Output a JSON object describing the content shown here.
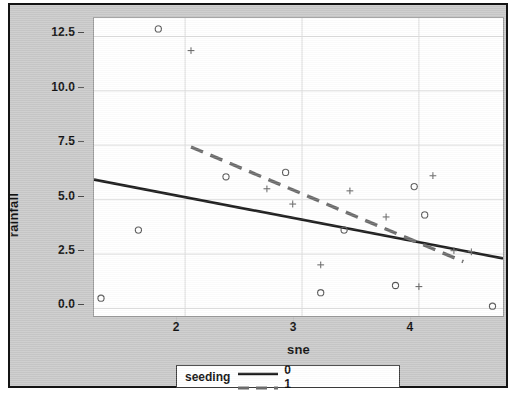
{
  "scan": {
    "top_strip_text": "· · ·"
  },
  "legend": {
    "title": "seeding",
    "entries": [
      {
        "label": "0",
        "style": "solid",
        "color": "#1a1a1a"
      },
      {
        "label": "1",
        "style": "dashed",
        "color": "#6b6b6b"
      }
    ]
  },
  "chart_data": {
    "type": "scatter",
    "title": "",
    "xlabel": "sne",
    "ylabel": "rainfall",
    "xlim": [
      1.22,
      4.72
    ],
    "ylim": [
      -0.35,
      13.35
    ],
    "xticks": [
      2,
      3,
      4
    ],
    "xtick_labels": [
      "2",
      "3",
      "4"
    ],
    "yticks": [
      0.0,
      2.5,
      5.0,
      7.5,
      10.0,
      12.5
    ],
    "ytick_labels": [
      "0.0",
      "2.5",
      "5.0",
      "7.5",
      "10.0",
      "12.5"
    ],
    "grid": true,
    "grid_color": "#dcdcdc",
    "legend_position": "below-axes",
    "series": [
      {
        "name": "0",
        "marker": "circle",
        "color": "#555555",
        "points": [
          {
            "x": 1.28,
            "y": 0.47
          },
          {
            "x": 1.6,
            "y": 3.6
          },
          {
            "x": 1.77,
            "y": 12.85
          },
          {
            "x": 2.35,
            "y": 6.05
          },
          {
            "x": 2.86,
            "y": 6.25
          },
          {
            "x": 3.16,
            "y": 0.72
          },
          {
            "x": 3.36,
            "y": 3.6
          },
          {
            "x": 3.8,
            "y": 1.05
          },
          {
            "x": 3.96,
            "y": 5.6
          },
          {
            "x": 4.05,
            "y": 4.3
          },
          {
            "x": 4.63,
            "y": 0.1
          }
        ]
      },
      {
        "name": "1",
        "marker": "plus",
        "color": "#6b6b6b",
        "points": [
          {
            "x": 2.05,
            "y": 11.85
          },
          {
            "x": 2.7,
            "y": 5.5
          },
          {
            "x": 2.92,
            "y": 4.8
          },
          {
            "x": 3.16,
            "y": 2.0
          },
          {
            "x": 3.41,
            "y": 5.4
          },
          {
            "x": 3.72,
            "y": 4.2
          },
          {
            "x": 4.0,
            "y": 1.0
          },
          {
            "x": 4.12,
            "y": 6.1
          },
          {
            "x": 4.3,
            "y": 2.65
          },
          {
            "x": 4.45,
            "y": 2.6
          }
        ]
      }
    ],
    "fit_lines": [
      {
        "name": "0",
        "style": "solid",
        "color": "#1a1a1a",
        "x0": 1.22,
        "y0": 5.92,
        "x1": 4.72,
        "y1": 2.3
      },
      {
        "name": "1",
        "style": "dashed",
        "color": "#6b6b6b",
        "x0": 2.05,
        "y0": 7.42,
        "x1": 4.38,
        "y1": 2.15
      }
    ]
  }
}
